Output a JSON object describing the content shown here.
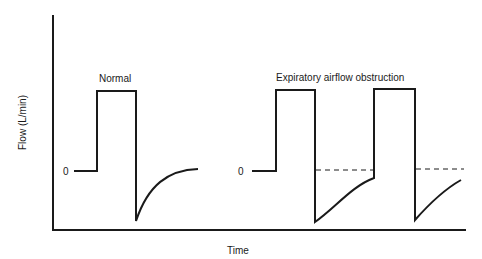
{
  "diagram": {
    "y_axis_label": "Flow (L/min)",
    "x_axis_label": "Time",
    "zero_label_normal": "0",
    "zero_label_obstruction": "0",
    "panels": [
      {
        "title": "Normal",
        "description": "Square inspiratory flow; expiratory flow returns to zero before next breath"
      },
      {
        "title": "Expiratory airflow obstruction",
        "description": "Expiratory flow does not return to zero before next breath (dashed zero reference line)"
      }
    ],
    "colors": {
      "line": "#1a1a1a",
      "background": "#ffffff"
    }
  }
}
